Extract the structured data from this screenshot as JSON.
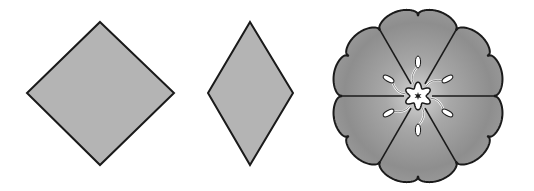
{
  "figure": {
    "shapes": [
      {
        "name": "square-diamond",
        "points": [
          [
            100,
            22
          ],
          [
            174,
            93
          ],
          [
            100,
            165
          ],
          [
            27,
            93
          ]
        ],
        "fill": "#b4b4b4",
        "stroke": "#1a1a1a"
      },
      {
        "name": "rhombus",
        "points": [
          [
            250,
            22
          ],
          [
            293,
            93
          ],
          [
            250,
            165
          ],
          [
            208,
            93
          ]
        ],
        "fill": "#b4b4b4",
        "stroke": "#1a1a1a"
      },
      {
        "name": "flower",
        "center": [
          418,
          96
        ],
        "petals": 6,
        "outer_radius": 88,
        "center_fill": "#ffffff",
        "petal_fill_outer": "#8a8a8a",
        "petal_fill_inner": "#c8c8c8",
        "stroke": "#1a1a1a"
      }
    ]
  }
}
